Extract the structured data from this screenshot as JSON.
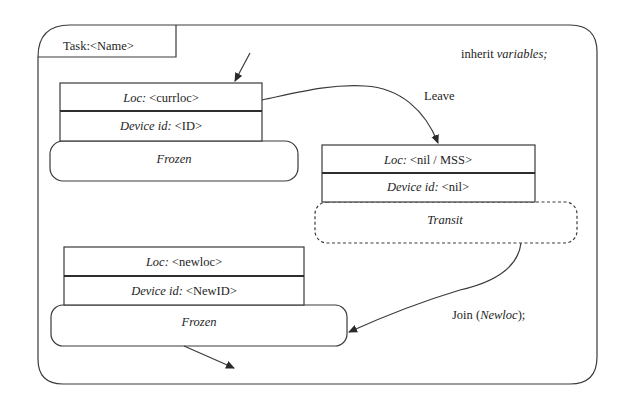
{
  "task_tab": {
    "label": "Task:<Name>"
  },
  "inherit_note": {
    "keyword": "inherit",
    "value": "variables;"
  },
  "states": [
    {
      "loc_key": "Loc:",
      "loc_value": "<currloc>",
      "device_key": "Device id:",
      "device_value": "<ID>",
      "status": "Frozen",
      "status_style": "solid"
    },
    {
      "loc_key": "Loc:",
      "loc_value": "<nil / MSS>",
      "device_key": "Device id:",
      "device_value": "<nil>",
      "status": "Transit",
      "status_style": "dashed"
    },
    {
      "loc_key": "Loc:",
      "loc_value": "<newloc>",
      "device_key": "Device id:",
      "device_value": "<NewID>",
      "status": "Frozen",
      "status_style": "solid"
    }
  ],
  "transitions": {
    "leave": {
      "label": "Leave"
    },
    "join": {
      "prefix": "Join (",
      "arg": "Newloc",
      "suffix": ");"
    }
  },
  "colors": {
    "stroke": "#3a3a3a",
    "text": "#1e1e1e",
    "background": "#ffffff"
  }
}
